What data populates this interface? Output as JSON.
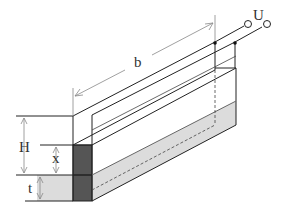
{
  "diagram": {
    "labels": {
      "length": "b",
      "voltage": "U",
      "height": "H",
      "level": "x",
      "thickness": "t"
    },
    "colors": {
      "line": "#222222",
      "dimension": "#888888",
      "liquid": "#dcdcdc",
      "dielectric": "#555555",
      "background": "#ffffff"
    }
  }
}
